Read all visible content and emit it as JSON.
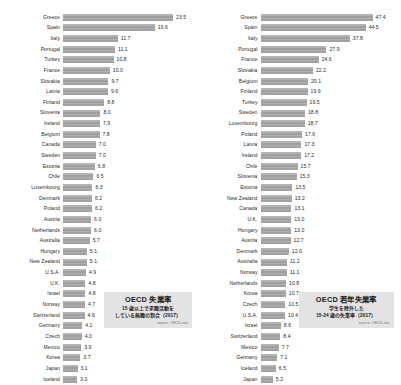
{
  "chart_data": [
    {
      "type": "bar",
      "orientation": "horizontal",
      "title": "OECD 失業率",
      "subtitle": "15 歳以上で求職活動を\nしている無職の割合（2017）",
      "source": "source: OECD.stat",
      "xlabel": "",
      "ylabel": "",
      "xlim": [
        0,
        23.5
      ],
      "grid": false,
      "legend": "none",
      "categories": [
        "Greece",
        "Spain",
        "Italy",
        "Portugal",
        "Turkey",
        "France",
        "Slovakia",
        "Latvia",
        "Finland",
        "Slovenia",
        "Ireland",
        "Belgium",
        "Canada",
        "Sweden",
        "Estonia",
        "Chile",
        "Luxembourg",
        "Denmark",
        "Poland",
        "Austria",
        "Netherlands",
        "Australia",
        "Hungary",
        "New Zealand",
        "U.S.A.",
        "U.K.",
        "Israel",
        "Norway",
        "Switzerland",
        "Germany",
        "Czech",
        "Mexico",
        "Korea",
        "Japan",
        "Iceland"
      ],
      "values": [
        23.5,
        19.6,
        11.7,
        11.1,
        10.8,
        10.0,
        9.7,
        9.6,
        8.8,
        8.0,
        7.9,
        7.8,
        7.0,
        7.0,
        6.8,
        6.5,
        6.3,
        6.2,
        6.2,
        6.0,
        6.0,
        5.7,
        5.1,
        5.1,
        4.9,
        4.8,
        4.8,
        4.7,
        4.6,
        4.1,
        4.0,
        3.9,
        3.7,
        3.1,
        3.0
      ]
    },
    {
      "type": "bar",
      "orientation": "horizontal",
      "title": "OECD 若年失業率",
      "subtitle": "学生を除外した\n15-24 歳の失業率（2017）",
      "source": "source: OECD.stat",
      "xlabel": "",
      "ylabel": "",
      "xlim": [
        0,
        47.4
      ],
      "grid": false,
      "legend": "none",
      "categories": [
        "Greece",
        "Spain",
        "Italy",
        "Portugal",
        "France",
        "Slovakia",
        "Belgium",
        "Finland",
        "Turkey",
        "Sweden",
        "Luxembourg",
        "Poland",
        "Latvia",
        "Ireland",
        "Chile",
        "Slovenia",
        "Estonia",
        "New Zealand",
        "Canada",
        "U.K.",
        "Hungary",
        "Austria",
        "Denmark",
        "Australia",
        "Norway",
        "Netherlands",
        "Korea",
        "Czech",
        "U.S.A.",
        "Israel",
        "Switzerland",
        "Mexico",
        "Germany",
        "Iceland",
        "Japan"
      ],
      "values": [
        47.4,
        44.5,
        37.8,
        27.9,
        24.6,
        22.2,
        20.1,
        19.9,
        19.5,
        18.8,
        18.7,
        17.6,
        17.3,
        17.2,
        15.7,
        15.3,
        13.5,
        13.2,
        13.1,
        13.0,
        13.0,
        12.7,
        12.0,
        11.2,
        11.1,
        10.8,
        10.7,
        10.5,
        10.4,
        8.6,
        8.4,
        7.7,
        7.1,
        6.5,
        5.2
      ]
    }
  ]
}
